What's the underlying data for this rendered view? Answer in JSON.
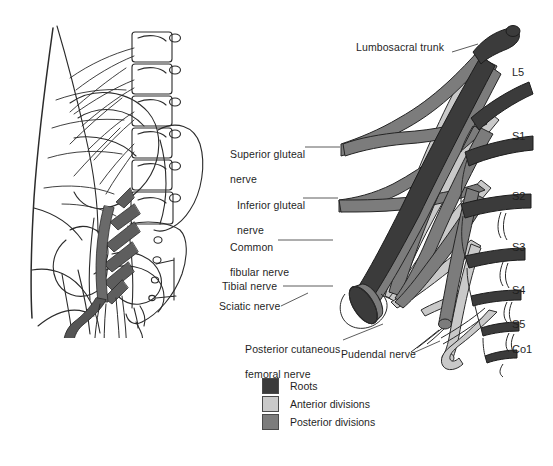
{
  "figure": {
    "panels": {
      "left": "anatomical-illustration-lumbosacral-spine-pelvis",
      "right": "sacral-plexus-schematic"
    }
  },
  "nerve_labels": [
    {
      "id": "lumbosacral-trunk",
      "text": "Lumbosacral trunk",
      "lines": [
        "Lumbosacral trunk"
      ],
      "x": 356,
      "y": 47,
      "anchor": "right",
      "leader": {
        "x1": 452,
        "y1": 52,
        "x2": 476,
        "y2": 45
      }
    },
    {
      "id": "superior-gluteal-nerve",
      "text": "Superior gluteal nerve",
      "lines": [
        "Superior gluteal",
        "nerve"
      ],
      "x": 218,
      "y": 141,
      "anchor": "right",
      "leader": {
        "x1": 305,
        "y1": 147,
        "x2": 338,
        "y2": 147
      }
    },
    {
      "id": "inferior-gluteal-nerve",
      "text": "Inferior gluteal nerve",
      "lines": [
        "Inferior gluteal",
        "nerve"
      ],
      "x": 225,
      "y": 192,
      "anchor": "right",
      "leader": {
        "x1": 303,
        "y1": 198,
        "x2": 336,
        "y2": 198
      }
    },
    {
      "id": "common-fibular-nerve",
      "text": "Common fibular nerve",
      "lines": [
        "Common",
        "fibular nerve"
      ],
      "x": 218,
      "y": 234,
      "anchor": "right",
      "leader": {
        "x1": 278,
        "y1": 240,
        "x2": 330,
        "y2": 240
      }
    },
    {
      "id": "tibial-nerve",
      "text": "Tibial nerve",
      "lines": [
        "Tibial nerve"
      ],
      "x": 222,
      "y": 281,
      "anchor": "right",
      "leader": {
        "x1": 283,
        "y1": 286,
        "x2": 330,
        "y2": 286
      }
    },
    {
      "id": "sciatic-nerve",
      "text": "Sciatic nerve",
      "lines": [
        "Sciatic nerve"
      ],
      "x": 219,
      "y": 303,
      "anchor": "right",
      "leader": {
        "x1": 280,
        "y1": 307,
        "x2": 305,
        "y2": 295
      }
    },
    {
      "id": "posterior-cutaneous-femoral-nerve",
      "text": "Posterior cutaneous femoral nerve",
      "lines": [
        "Posterior cutaneous",
        "femoral nerve"
      ],
      "x": 233,
      "y": 336,
      "anchor": "right",
      "leader": {
        "x1": 342,
        "y1": 341,
        "x2": 381,
        "y2": 325
      }
    },
    {
      "id": "pudendal-nerve",
      "text": "Pudendal nerve",
      "lines": [
        "Pudendal nerve"
      ],
      "x": 341,
      "y": 354,
      "anchor": "right",
      "leader": {
        "x1": 412,
        "y1": 354,
        "x2": 438,
        "y2": 342
      }
    }
  ],
  "root_labels": [
    {
      "id": "root-l5",
      "text": "L5",
      "x": 512,
      "y": 73
    },
    {
      "id": "root-s1",
      "text": "S1",
      "x": 512,
      "y": 137
    },
    {
      "id": "root-s2",
      "text": "S2",
      "x": 512,
      "y": 197
    },
    {
      "id": "root-s3",
      "text": "S3",
      "x": 512,
      "y": 248
    },
    {
      "id": "root-s4",
      "text": "S4",
      "x": 512,
      "y": 291
    },
    {
      "id": "root-s5",
      "text": "S5",
      "x": 512,
      "y": 325
    },
    {
      "id": "root-co1",
      "text": "Co1",
      "x": 512,
      "y": 350
    }
  ],
  "legend": {
    "items": [
      {
        "id": "legend-roots",
        "label": "Roots",
        "color": "#3b3b3b"
      },
      {
        "id": "legend-anterior-divisions",
        "label": "Anterior divisions",
        "color": "#c9c9c9"
      },
      {
        "id": "legend-posterior-divisions",
        "label": "Posterior divisions",
        "color": "#7c7c7c"
      }
    ]
  },
  "colors": {
    "roots": "#3b3b3b",
    "anterior_divisions": "#c9c9c9",
    "posterior_divisions": "#7c7c7c",
    "outline": "#2b2b2b",
    "leader_line": "#4a4a4a",
    "background": "#ffffff"
  }
}
